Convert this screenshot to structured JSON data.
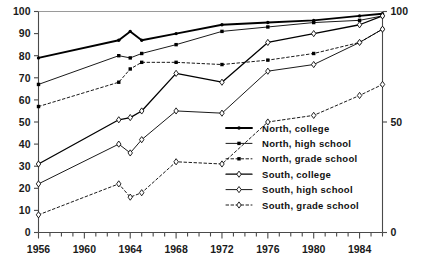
{
  "chart_data": {
    "type": "line",
    "title": "",
    "subtitle": "",
    "xlabel": "",
    "ylabel": "",
    "xlim": [
      1956,
      1986
    ],
    "ylim": [
      0,
      100
    ],
    "grid": false,
    "legend_position": "inside-right",
    "x_tick_labels": [
      "1956",
      "1960",
      "1964",
      "1968",
      "1972",
      "1976",
      "1980",
      "1984"
    ],
    "x_tick_values": [
      1956,
      1960,
      1964,
      1968,
      1972,
      1976,
      1980,
      1984
    ],
    "x_minor_tick_interval": 1,
    "y_tick_labels": [
      "0",
      "10",
      "20",
      "30",
      "40",
      "50",
      "60",
      "70",
      "80",
      "90",
      "100"
    ],
    "y_tick_values": [
      0,
      10,
      20,
      30,
      40,
      50,
      60,
      70,
      80,
      90,
      100
    ],
    "y_right_tick_labels": [
      "0",
      "50",
      "100"
    ],
    "y_right_tick_values": [
      0,
      50,
      100
    ],
    "series": [
      {
        "name": "North, college",
        "key": "north_college",
        "color": "#000000",
        "line_style": "solid",
        "line_width": 1.9,
        "marker": "dot",
        "x": [
          1956,
          1963,
          1964,
          1965,
          1968,
          1972,
          1976,
          1980,
          1984,
          1986
        ],
        "values": [
          79,
          87,
          91,
          87,
          90,
          94,
          95,
          96,
          98,
          99
        ]
      },
      {
        "name": "North, high school",
        "key": "north_high_school",
        "color": "#000000",
        "line_style": "solid",
        "line_width": 0.9,
        "marker": "square",
        "x": [
          1956,
          1963,
          1964,
          1965,
          1968,
          1972,
          1976,
          1980,
          1984,
          1986
        ],
        "values": [
          67,
          80,
          79,
          81,
          85,
          91,
          93,
          95,
          96,
          98
        ]
      },
      {
        "name": "North, grade school",
        "key": "north_grade_school",
        "color": "#000000",
        "line_style": "dashed",
        "line_width": 0.9,
        "marker": "square",
        "x": [
          1956,
          1963,
          1964,
          1965,
          1968,
          1972,
          1976,
          1980,
          1984,
          1986
        ],
        "values": [
          57,
          68,
          74,
          77,
          77,
          76,
          78,
          81,
          86,
          92
        ]
      },
      {
        "name": "South, college",
        "key": "south_college",
        "color": "#000000",
        "line_style": "solid",
        "line_width": 1.3,
        "marker": "diamond",
        "x": [
          1956,
          1963,
          1964,
          1965,
          1968,
          1972,
          1976,
          1980,
          1984,
          1986
        ],
        "values": [
          31,
          51,
          52,
          55,
          72,
          68,
          86,
          90,
          94,
          98
        ]
      },
      {
        "name": "South, high school",
        "key": "south_high_school",
        "color": "#000000",
        "line_style": "solid",
        "line_width": 0.9,
        "marker": "diamond",
        "x": [
          1956,
          1963,
          1964,
          1965,
          1968,
          1972,
          1976,
          1980,
          1984,
          1986
        ],
        "values": [
          22,
          40,
          36,
          42,
          55,
          54,
          73,
          76,
          86,
          92
        ]
      },
      {
        "name": "South, grade school",
        "key": "south_grade_school",
        "color": "#000000",
        "line_style": "dashed",
        "line_width": 0.9,
        "marker": "diamond",
        "x": [
          1956,
          1963,
          1964,
          1965,
          1968,
          1972,
          1976,
          1980,
          1984,
          1986
        ],
        "values": [
          8,
          22,
          16,
          18,
          32,
          31,
          50,
          53,
          62,
          67
        ]
      }
    ],
    "legend": [
      {
        "label": "North, college",
        "key": "north_college"
      },
      {
        "label": "North, high school",
        "key": "north_high_school"
      },
      {
        "label": "North, grade school",
        "key": "north_grade_school"
      },
      {
        "label": "South, college",
        "key": "south_college"
      },
      {
        "label": "South, high school",
        "key": "south_high_school"
      },
      {
        "label": "South, grade school",
        "key": "south_grade_school"
      }
    ]
  }
}
